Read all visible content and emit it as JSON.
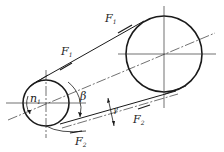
{
  "diagram": {
    "type": "belt-drive",
    "colors": {
      "line": "#1a1a1a",
      "background": "#ffffff"
    },
    "small_pulley": {
      "speed_label": "n",
      "speed_subscript": "1"
    },
    "large_pulley": {},
    "labels": {
      "f1_top": {
        "base": "F",
        "sub": "1"
      },
      "f1_mid": {
        "base": "F",
        "sub": "1"
      },
      "f2_right": {
        "base": "F",
        "sub": "2"
      },
      "f2_bottom": {
        "base": "F",
        "sub": "2"
      },
      "wrap_angle": "β",
      "belt_angle": "γ"
    }
  }
}
